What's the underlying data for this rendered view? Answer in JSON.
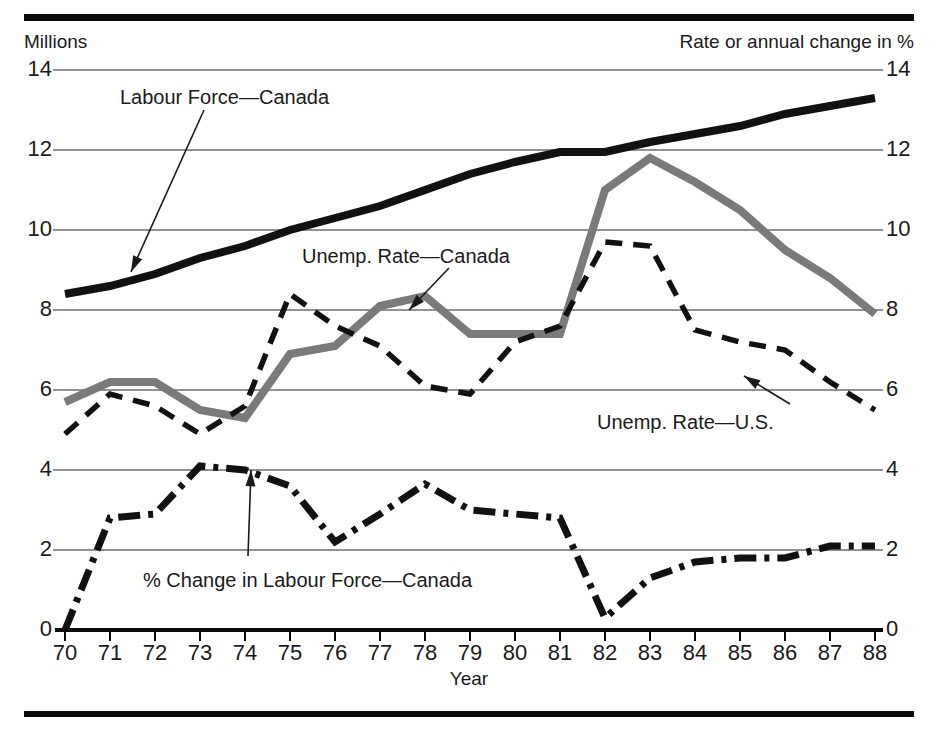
{
  "figure": {
    "left_axis_title": "Millions",
    "right_axis_title": "Rate or annual change in %",
    "x_axis_title": "Year"
  },
  "annotations": {
    "labour_force": "Labour Force—Canada",
    "unemp_canada": "Unemp. Rate—Canada",
    "unemp_us": "Unemp. Rate—U.S.",
    "pct_change": "% Change in Labour Force—Canada"
  },
  "colors": {
    "labour_force": "#111111",
    "unemp_canada": "#7a7a7a",
    "unemp_us": "#111111",
    "pct_change": "#111111",
    "grid": "#6e6e6e",
    "axis": "#0b0b0b"
  },
  "chart_data": {
    "type": "line",
    "title": "",
    "xlabel": "Year",
    "ylabel": "Millions",
    "ylabel_right": "Rate or annual change in %",
    "grid": true,
    "legend": "inline-annotations",
    "xlim": [
      1970,
      1988
    ],
    "ylim": [
      0,
      14
    ],
    "yticks": [
      0,
      2,
      4,
      6,
      8,
      10,
      12,
      14
    ],
    "yticks_right": [
      0,
      2,
      4,
      6,
      8,
      10,
      12,
      14
    ],
    "x": [
      1970,
      1971,
      1972,
      1973,
      1974,
      1975,
      1976,
      1977,
      1978,
      1979,
      1980,
      1981,
      1982,
      1983,
      1984,
      1985,
      1986,
      1987,
      1988
    ],
    "xticklabels": [
      "70",
      "71",
      "72",
      "73",
      "74",
      "75",
      "76",
      "77",
      "78",
      "79",
      "80",
      "81",
      "82",
      "83",
      "84",
      "85",
      "86",
      "87",
      "88"
    ],
    "series": [
      {
        "name": "Labour Force—Canada",
        "unit": "millions",
        "style": "solid-thick",
        "color": "#111111",
        "values": [
          8.4,
          8.6,
          8.9,
          9.3,
          9.6,
          10.0,
          10.3,
          10.6,
          11.0,
          11.4,
          11.7,
          11.95,
          11.95,
          12.2,
          12.4,
          12.6,
          12.9,
          13.1,
          13.3
        ]
      },
      {
        "name": "Unemp. Rate—Canada",
        "unit": "percent",
        "style": "solid-thick-gray",
        "color": "#7a7a7a",
        "values": [
          5.7,
          6.2,
          6.2,
          5.5,
          5.3,
          6.9,
          7.1,
          8.1,
          8.35,
          7.4,
          7.4,
          7.4,
          11.0,
          11.8,
          11.2,
          10.5,
          9.5,
          8.8,
          7.9
        ]
      },
      {
        "name": "Unemp. Rate—U.S.",
        "unit": "percent",
        "style": "dashed",
        "color": "#111111",
        "values": [
          4.9,
          5.9,
          5.6,
          4.9,
          5.6,
          8.4,
          7.6,
          7.1,
          6.1,
          5.9,
          7.2,
          7.6,
          9.7,
          9.6,
          7.5,
          7.2,
          7.0,
          6.2,
          5.5
        ]
      },
      {
        "name": "% Change in Labour Force—Canada",
        "unit": "percent",
        "style": "dash-dot",
        "color": "#111111",
        "values": [
          0.0,
          2.8,
          2.9,
          4.1,
          4.0,
          3.6,
          2.2,
          2.9,
          3.65,
          3.0,
          2.9,
          2.8,
          0.3,
          1.3,
          1.7,
          1.8,
          1.8,
          2.1,
          2.1
        ]
      }
    ]
  }
}
